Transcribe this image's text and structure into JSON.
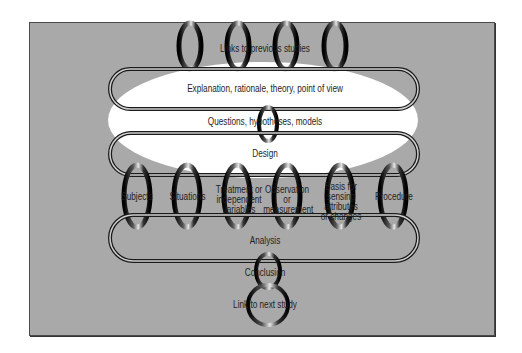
{
  "diagram": {
    "type": "research-process-chain",
    "colors": {
      "panel": "#a9a9a9",
      "panel_border": "#4a4a4a",
      "ellipse": "#ffffff",
      "ring_dark": "#111111",
      "ring_light": "#d8d8d8",
      "text": "#1e1e1e"
    },
    "links_to_previous": {
      "label": "Links to previous studies",
      "ring_count": 4
    },
    "explanation": {
      "label": "Explanation, rationale, theory, point of view"
    },
    "questions": {
      "label": "Questions, hypotheses, models"
    },
    "design": {
      "label": "Design"
    },
    "components": [
      {
        "label": "Subjects"
      },
      {
        "label": "Situations"
      },
      {
        "label": "Treatment or independent variables"
      },
      {
        "label": "Observation or measurement"
      },
      {
        "label": "Basis for sensing attributes or changes"
      },
      {
        "label": "Procedure"
      }
    ],
    "analysis": {
      "label": "Analysis"
    },
    "conclusion": {
      "label": "Conclusion"
    },
    "link_next": {
      "label": "Link to next study"
    }
  }
}
